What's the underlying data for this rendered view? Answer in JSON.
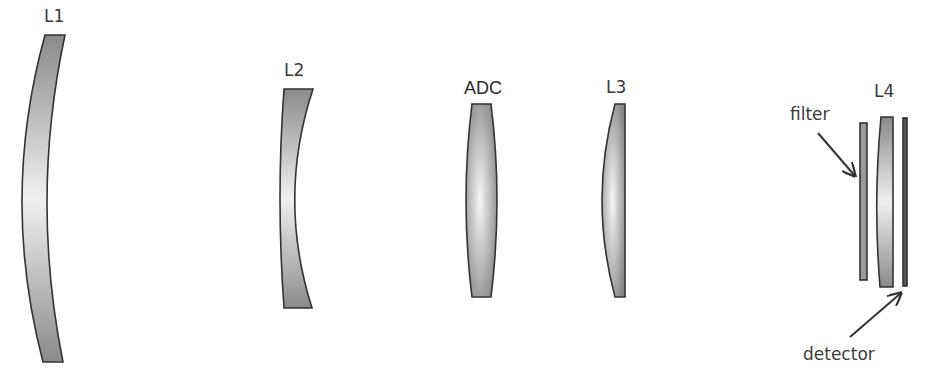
{
  "diagram": {
    "colors": {
      "lens_dark": "#8c8c8c",
      "lens_light": "#f2f2f2",
      "stroke": "#333333",
      "text": "#3a3a3a"
    },
    "elements": [
      {
        "id": "L1",
        "label": "L1",
        "type": "meniscus lens"
      },
      {
        "id": "L2",
        "label": "L2",
        "type": "concave lens"
      },
      {
        "id": "ADC",
        "label": "ADC",
        "type": "biconvex lens"
      },
      {
        "id": "L3",
        "label": "L3",
        "type": "plano-convex lens"
      },
      {
        "id": "filter",
        "label": "filter",
        "type": "filter plate"
      },
      {
        "id": "L4",
        "label": "L4",
        "type": "lens"
      },
      {
        "id": "detector",
        "label": "detector",
        "type": "detector plane"
      }
    ],
    "annotations": {
      "filter": "filter",
      "detector": "detector"
    }
  }
}
